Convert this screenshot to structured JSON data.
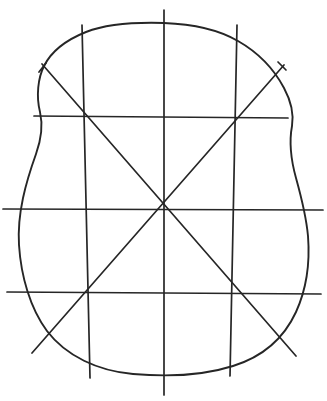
{
  "document": {
    "title": "Hand-drawn grid figure",
    "description": "Monochrome line drawing of an irregular rounded quadrilateral outline overlaid with a hand-drawn grid and two diagonals",
    "background_color": "#ffffff",
    "ink_color": "#262626",
    "canvas": {
      "width": 327,
      "height": 401
    }
  },
  "figure": {
    "center_point": {
      "x": 163,
      "y": 209
    },
    "outline": {
      "name": "rounded-quadrilateral-outline",
      "closed": true,
      "stroke_width": 1.9,
      "path": "M 164,23 C 132,22 104,25 86,32 C 66,40 51,52 44,66 C 38,78 36,96 40,112 C 43,125 41,140 36,154 C 26,182 17,213 19,245 C 21,276 30,308 47,331 C 66,356 98,371 133,374 C 168,377 205,375 233,366 C 262,357 284,338 296,312 C 307,288 310,262 308,236 C 306,214 301,196 296,178 C 291,160 289,142 292,126 C 294,114 291,101 284,88 C 275,71 259,53 238,41 C 219,30 192,24 164,23 Z"
    },
    "grid_lines": {
      "horizontal": [
        {
          "name": "horizontal-line-upper",
          "x1": 34,
          "y1": 116,
          "x2": 288,
          "y2": 118
        },
        {
          "name": "horizontal-line-center",
          "x1": 3,
          "y1": 209,
          "x2": 323,
          "y2": 210
        },
        {
          "name": "horizontal-line-lower",
          "x1": 7,
          "y1": 292,
          "x2": 321,
          "y2": 294
        }
      ],
      "vertical": [
        {
          "name": "vertical-line-left",
          "x1": 82,
          "y1": 25,
          "x2": 90,
          "y2": 378
        },
        {
          "name": "vertical-line-center",
          "x1": 164,
          "y1": 10,
          "x2": 164,
          "y2": 395
        },
        {
          "name": "vertical-line-right",
          "x1": 237,
          "y1": 25,
          "x2": 230,
          "y2": 376
        }
      ]
    },
    "diagonals": [
      {
        "name": "diagonal-nw-se",
        "x1": 42,
        "y1": 64,
        "x2": 296,
        "y2": 356
      },
      {
        "name": "diagonal-ne-sw",
        "x1": 284,
        "y1": 65,
        "x2": 32,
        "y2": 353
      }
    ],
    "tick_marks": [
      {
        "name": "tick-diagonal-nw-start",
        "x1": 46,
        "y1": 63,
        "x2": 39,
        "y2": 72
      },
      {
        "name": "tick-diagonal-ne-start",
        "x1": 278,
        "y1": 62,
        "x2": 286,
        "y2": 70
      }
    ],
    "stroke_widths": {
      "outline": 1.9,
      "grid": 1.7,
      "diagonal": 1.7
    }
  }
}
